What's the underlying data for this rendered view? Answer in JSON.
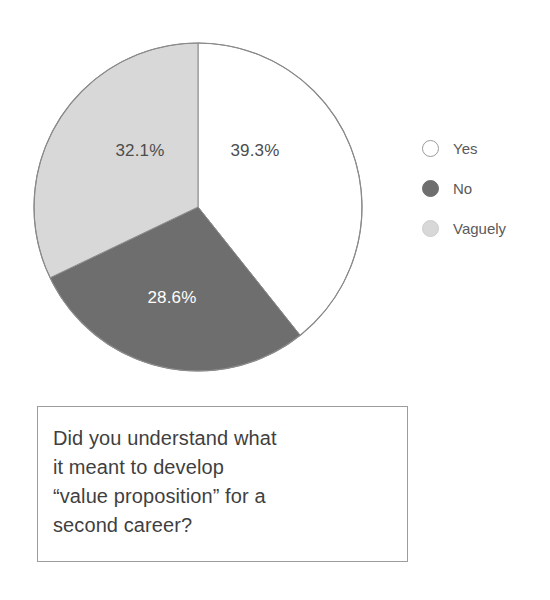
{
  "chart_data": {
    "type": "pie",
    "title": "",
    "categories": [
      "Yes",
      "No",
      "Vaguely"
    ],
    "values": [
      39.3,
      28.6,
      32.1
    ],
    "value_labels": [
      "39.3%",
      "28.6%",
      "32.1%"
    ],
    "units": "percent",
    "start_angle_deg": 0,
    "direction": "clockwise",
    "legend_position": "right",
    "grid": false,
    "colors": [
      "#ffffff",
      "#6e6e6e",
      "#d8d8d8"
    ],
    "label_text_colors": [
      "#4d4d4d",
      "#ffffff",
      "#4d4d4d"
    ],
    "outline_color": "#8a8a8a"
  },
  "pie": {
    "slices": [
      {
        "name": "Yes",
        "label": "39.3%",
        "value": 39.3,
        "fill": "#ffffff",
        "label_color": "#4d4d4d",
        "label_x": 222,
        "label_y": 110
      },
      {
        "name": "No",
        "label": "28.6%",
        "value": 28.6,
        "fill": "#6e6e6e",
        "label_color": "#ffffff",
        "label_x": 139,
        "label_y": 257
      },
      {
        "name": "Vaguely",
        "label": "32.1%",
        "value": 32.1,
        "fill": "#d8d8d8",
        "label_color": "#4d4d4d",
        "label_x": 107,
        "label_y": 110
      }
    ]
  },
  "legend": {
    "items": [
      {
        "label": "Yes",
        "swatch": "white-outline-circle"
      },
      {
        "label": "No",
        "swatch": "dark-gray-circle"
      },
      {
        "label": "Vaguely",
        "swatch": "light-gray-circle"
      }
    ]
  },
  "caption": {
    "lines": [
      "Did you understand what",
      "it meant to develop",
      "“value proposition” for a",
      "second career?"
    ],
    "full_text": "Did you understand what it meant to develop “value proposition” for a second career?"
  }
}
